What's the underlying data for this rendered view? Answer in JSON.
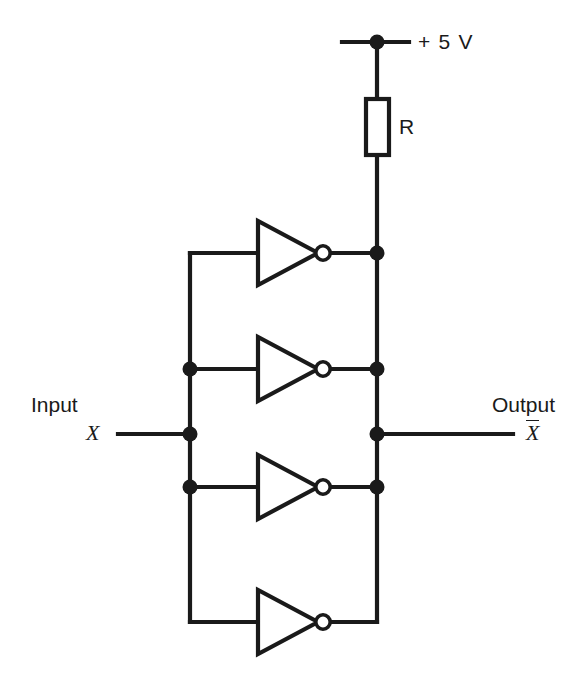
{
  "diagram": {
    "type": "schematic",
    "background_color": "#ffffff",
    "line_color": "#1a1a1a",
    "labels": {
      "supply": "+ 5 V",
      "resistor": "R",
      "input_word": "Input",
      "input_variable": "X",
      "output_word": "Output",
      "output_variable": "X"
    },
    "components": [
      {
        "id": "supply-rail",
        "kind": "power-rail",
        "label": "+ 5 V",
        "node_x": 377,
        "node_y": 42
      },
      {
        "id": "resistor-r",
        "kind": "resistor",
        "label": "R",
        "x": 366,
        "y": 99,
        "width": 23,
        "height": 56
      },
      {
        "id": "inverter-1",
        "kind": "inverter",
        "row_y": 253,
        "tip_x": 318,
        "base_x": 258,
        "bubble_x": 323
      },
      {
        "id": "inverter-2",
        "kind": "inverter",
        "row_y": 369,
        "tip_x": 318,
        "base_x": 258,
        "bubble_x": 323
      },
      {
        "id": "inverter-3",
        "kind": "inverter",
        "row_y": 487,
        "tip_x": 318,
        "base_x": 258,
        "bubble_x": 323
      },
      {
        "id": "inverter-4",
        "kind": "inverter",
        "row_y": 622,
        "tip_x": 318,
        "base_x": 258,
        "bubble_x": 323
      }
    ],
    "buses": {
      "input_bus_x": 190,
      "output_bus_x": 377,
      "input_row_y": 434,
      "output_row_y": 434,
      "top_row_y": 253,
      "bottom_row_y": 622
    },
    "junction_dots": [
      {
        "x": 377,
        "y": 42,
        "name": "supply-node"
      },
      {
        "x": 377,
        "y": 253,
        "name": "output-node-inverter-1"
      },
      {
        "x": 190,
        "y": 369,
        "name": "input-node-inverter-2"
      },
      {
        "x": 377,
        "y": 369,
        "name": "output-node-inverter-2"
      },
      {
        "x": 190,
        "y": 434,
        "name": "input-signal-node"
      },
      {
        "x": 377,
        "y": 434,
        "name": "output-signal-node"
      },
      {
        "x": 190,
        "y": 487,
        "name": "input-node-inverter-3"
      },
      {
        "x": 377,
        "y": 487,
        "name": "output-node-inverter-3"
      }
    ]
  }
}
